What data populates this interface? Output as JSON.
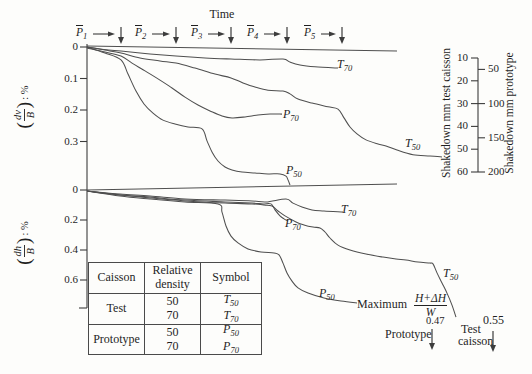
{
  "colors": {
    "line": "#4f4f4f",
    "axis": "#3c3c3c",
    "text": "#1f1f1f",
    "background": "#fdfdfb"
  },
  "time_title": "Time",
  "load_parcels": {
    "labels": [
      {
        "base": "P",
        "sub": "1",
        "overline": true
      },
      {
        "base": "P",
        "sub": "2",
        "overline": true
      },
      {
        "base": "P",
        "sub": "3",
        "overline": true
      },
      {
        "base": "P",
        "sub": "4",
        "overline": true
      },
      {
        "base": "P",
        "sub": "5",
        "overline": true
      }
    ]
  },
  "left_axes": [
    {
      "numerator": "dv",
      "denominator": "B",
      "suffix": ": %"
    },
    {
      "numerator": "dh",
      "denominator": "B",
      "suffix": ": %"
    }
  ],
  "right_scales": {
    "left": {
      "title": "Shakedown mm test caisson",
      "ticks": [
        "10",
        "20",
        "30",
        "40",
        "50",
        "60"
      ]
    },
    "right": {
      "title": "Shakedown mm prototype",
      "ticks": [
        "50",
        "100",
        "150",
        "200"
      ]
    }
  },
  "table": {
    "headers": [
      "Caisson",
      "Relative density",
      "Symbol"
    ],
    "rows": [
      {
        "caisson": "Test",
        "densities": [
          "50",
          "70"
        ],
        "symbols": [
          {
            "base": "T",
            "sub": "50"
          },
          {
            "base": "T",
            "sub": "70"
          }
        ]
      },
      {
        "caisson": "Prototype",
        "densities": [
          "50",
          "70"
        ],
        "symbols": [
          {
            "base": "P",
            "sub": "50"
          },
          {
            "base": "P",
            "sub": "70"
          }
        ]
      }
    ]
  },
  "annotation": {
    "maximum": "Maximum",
    "fraction": {
      "numerator": "H+ΔH",
      "denominator": "W"
    },
    "prototype_value": "0.47",
    "prototype_label": "Prototype",
    "test_value": "0.55",
    "test_label_line1": "Test",
    "test_label_line2": "caisson"
  },
  "chart_data": [
    {
      "type": "line",
      "id": "vertical-displacement",
      "ylabel": "(dv/B): %",
      "xlabel": "Time",
      "ylim": [
        0,
        0.45
      ],
      "yticks": {
        "values": [
          0,
          0.1,
          0.2,
          0.3
        ],
        "labels": [
          "0",
          "0.1",
          "0.2",
          "0.3"
        ]
      },
      "series": [
        {
          "name": "applied-load",
          "label": null,
          "points": [
            [
              0,
              -0.003
            ],
            [
              310,
              0.013
            ]
          ]
        },
        {
          "name": "T70",
          "label": {
            "base": "T",
            "sub": "70"
          },
          "points": [
            [
              0,
              0
            ],
            [
              13,
              0.006
            ],
            [
              34,
              0.013
            ],
            [
              63,
              0.022
            ],
            [
              89,
              0.029
            ],
            [
              118,
              0.035
            ],
            [
              144,
              0.038
            ],
            [
              173,
              0.041
            ],
            [
              196,
              0.038
            ],
            [
              203,
              0.048
            ],
            [
              213,
              0.057
            ],
            [
              228,
              0.063
            ],
            [
              251,
              0.067
            ]
          ]
        },
        {
          "name": "P70",
          "label": {
            "base": "P",
            "sub": "70"
          },
          "points": [
            [
              0,
              0.003
            ],
            [
              18,
              0.016
            ],
            [
              34,
              0.029
            ],
            [
              45,
              0.051
            ],
            [
              58,
              0.076
            ],
            [
              73,
              0.105
            ],
            [
              85,
              0.13
            ],
            [
              98,
              0.159
            ],
            [
              111,
              0.184
            ],
            [
              123,
              0.203
            ],
            [
              135,
              0.219
            ],
            [
              145,
              0.225
            ],
            [
              158,
              0.222
            ],
            [
              171,
              0.216
            ],
            [
              183,
              0.213
            ],
            [
              195,
              0.213
            ]
          ]
        },
        {
          "name": "T50",
          "label": {
            "base": "T",
            "sub": "50"
          },
          "points": [
            [
              0,
              0
            ],
            [
              18,
              0.01
            ],
            [
              34,
              0.019
            ],
            [
              53,
              0.035
            ],
            [
              73,
              0.044
            ],
            [
              89,
              0.051
            ],
            [
              108,
              0.067
            ],
            [
              128,
              0.086
            ],
            [
              144,
              0.098
            ],
            [
              156,
              0.114
            ],
            [
              168,
              0.127
            ],
            [
              181,
              0.137
            ],
            [
              196,
              0.14
            ],
            [
              203,
              0.149
            ],
            [
              211,
              0.165
            ],
            [
              225,
              0.178
            ],
            [
              241,
              0.19
            ],
            [
              251,
              0.197
            ],
            [
              257,
              0.225
            ],
            [
              263,
              0.254
            ],
            [
              270,
              0.276
            ],
            [
              279,
              0.295
            ],
            [
              291,
              0.308
            ],
            [
              299,
              0.314
            ],
            [
              310,
              0.327
            ],
            [
              326,
              0.342
            ],
            [
              343,
              0.346
            ],
            [
              355,
              0.349
            ]
          ]
        },
        {
          "name": "P50",
          "label": {
            "base": "P",
            "sub": "50"
          },
          "points": [
            [
              0,
              0
            ],
            [
              18,
              0.019
            ],
            [
              34,
              0.041
            ],
            [
              41,
              0.086
            ],
            [
              49,
              0.14
            ],
            [
              57,
              0.181
            ],
            [
              66,
              0.21
            ],
            [
              76,
              0.232
            ],
            [
              88,
              0.244
            ],
            [
              101,
              0.254
            ],
            [
              115,
              0.26
            ],
            [
              120,
              0.298
            ],
            [
              125,
              0.333
            ],
            [
              131,
              0.362
            ],
            [
              138,
              0.381
            ],
            [
              145,
              0.39
            ],
            [
              155,
              0.397
            ],
            [
              168,
              0.4
            ],
            [
              181,
              0.403
            ],
            [
              193,
              0.403
            ],
            [
              199,
              0.41
            ],
            [
              201,
              0.422
            ],
            [
              203,
              0.438
            ]
          ]
        }
      ]
    },
    {
      "type": "line",
      "id": "horizontal-displacement",
      "ylabel": "(dh/B): %",
      "xlabel": "Time",
      "ylim": [
        0,
        0.9
      ],
      "yticks": {
        "values": [
          0,
          0.2,
          0.4,
          0.6
        ],
        "labels": [
          "0",
          "0.2",
          "0.4",
          "0.6"
        ]
      },
      "series": [
        {
          "name": "applied-load",
          "label": null,
          "points": [
            [
              0,
              0
            ],
            [
              310,
              -0.04
            ]
          ]
        },
        {
          "name": "T70",
          "label": {
            "base": "T",
            "sub": "70"
          },
          "points": [
            [
              0,
              0.007
            ],
            [
              33,
              0.027
            ],
            [
              63,
              0.04
            ],
            [
              98,
              0.06
            ],
            [
              138,
              0.067
            ],
            [
              165,
              0.073
            ],
            [
              179,
              0.08
            ],
            [
              199,
              0.06
            ],
            [
              206,
              0.087
            ],
            [
              215,
              0.113
            ],
            [
              225,
              0.133
            ],
            [
              237,
              0.14
            ],
            [
              256,
              0.147
            ]
          ]
        },
        {
          "name": "P70",
          "label": {
            "base": "P",
            "sub": "70"
          },
          "points": [
            [
              0,
              0.007
            ],
            [
              33,
              0.033
            ],
            [
              63,
              0.047
            ],
            [
              98,
              0.067
            ],
            [
              138,
              0.08
            ],
            [
              165,
              0.087
            ],
            [
              176,
              0.093
            ],
            [
              184,
              0.093
            ],
            [
              188,
              0.133
            ],
            [
              193,
              0.173
            ],
            [
              197,
              0.193
            ],
            [
              201,
              0.207
            ]
          ]
        },
        {
          "name": "T50",
          "label": {
            "base": "T",
            "sub": "50"
          },
          "points": [
            [
              0,
              0.007
            ],
            [
              33,
              0.033
            ],
            [
              63,
              0.053
            ],
            [
              98,
              0.073
            ],
            [
              138,
              0.087
            ],
            [
              165,
              0.093
            ],
            [
              177,
              0.1
            ],
            [
              185,
              0.107
            ],
            [
              191,
              0.14
            ],
            [
              198,
              0.173
            ],
            [
              209,
              0.213
            ],
            [
              217,
              0.233
            ],
            [
              226,
              0.247
            ],
            [
              233,
              0.253
            ],
            [
              238,
              0.28
            ],
            [
              243,
              0.32
            ],
            [
              251,
              0.367
            ],
            [
              263,
              0.4
            ],
            [
              279,
              0.427
            ],
            [
              296,
              0.447
            ],
            [
              309,
              0.46
            ],
            [
              319,
              0.467
            ],
            [
              331,
              0.48
            ],
            [
              343,
              0.487
            ],
            [
              346,
              0.493
            ],
            [
              350,
              0.553
            ],
            [
              355,
              0.62
            ],
            [
              360,
              0.687
            ],
            [
              365,
              0.767
            ],
            [
              369,
              0.847
            ]
          ]
        },
        {
          "name": "P50",
          "label": {
            "base": "P",
            "sub": "50"
          },
          "points": [
            [
              0,
              0.007
            ],
            [
              33,
              0.04
            ],
            [
              63,
              0.06
            ],
            [
              98,
              0.08
            ],
            [
              131,
              0.093
            ],
            [
              135,
              0.147
            ],
            [
              139,
              0.24
            ],
            [
              144,
              0.307
            ],
            [
              151,
              0.353
            ],
            [
              161,
              0.393
            ],
            [
              174,
              0.413
            ],
            [
              187,
              0.42
            ],
            [
              192,
              0.433
            ],
            [
              196,
              0.487
            ],
            [
              200,
              0.553
            ],
            [
              205,
              0.607
            ],
            [
              211,
              0.653
            ],
            [
              221,
              0.687
            ],
            [
              237,
              0.72
            ],
            [
              254,
              0.74
            ],
            [
              270,
              0.753
            ]
          ]
        }
      ]
    }
  ]
}
